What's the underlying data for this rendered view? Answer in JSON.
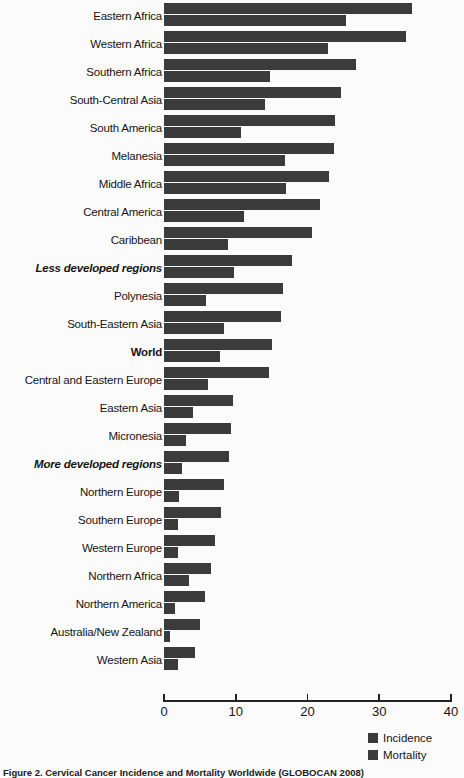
{
  "chart_data": {
    "type": "bar",
    "orientation": "horizontal",
    "title": "",
    "subtitle": "",
    "xlabel": "",
    "ylabel": "",
    "xlim": [
      0,
      40
    ],
    "xticks": [
      0,
      10,
      20,
      30,
      40
    ],
    "xtick_labels": [
      "0",
      "10",
      "20",
      "30",
      "40"
    ],
    "grid": false,
    "legend_position": "bottom-right",
    "bar_color": "#3b3b3b",
    "categories": [
      "Eastern Africa",
      "Western Africa",
      "Southern Africa",
      "South-Central Asia",
      "South America",
      "Melanesia",
      "Middle Africa",
      "Central America",
      "Caribbean",
      "Less developed regions",
      "Polynesia",
      "South-Eastern Asia",
      "World",
      "Central and Eastern Europe",
      "Eastern Asia",
      "Micronesia",
      "More developed regions",
      "Northern Europe",
      "Southern Europe",
      "Western Europe",
      "Northern Africa",
      "Northern America",
      "Australia/New Zealand",
      "Western Asia"
    ],
    "category_emphasis": [
      "none",
      "none",
      "none",
      "none",
      "none",
      "none",
      "none",
      "none",
      "none",
      "bold-italic",
      "none",
      "none",
      "bold",
      "none",
      "none",
      "none",
      "bold-italic",
      "none",
      "none",
      "none",
      "none",
      "none",
      "none",
      "none"
    ],
    "series": [
      {
        "name": "Incidence",
        "values": [
          34.5,
          33.7,
          26.8,
          24.6,
          23.9,
          23.7,
          23.0,
          21.7,
          20.6,
          17.8,
          16.6,
          16.3,
          15.1,
          14.6,
          9.6,
          9.4,
          9.0,
          8.4,
          7.9,
          7.1,
          6.6,
          5.7,
          5.0,
          4.3
        ]
      },
      {
        "name": "Mortality",
        "values": [
          25.3,
          22.8,
          14.8,
          14.1,
          10.8,
          16.8,
          17.0,
          11.1,
          8.9,
          9.8,
          5.9,
          8.3,
          7.8,
          6.1,
          4.0,
          3.0,
          2.5,
          2.1,
          2.0,
          1.9,
          3.5,
          1.6,
          0.9,
          2.0
        ]
      }
    ]
  },
  "legend": {
    "items": [
      {
        "label": "Incidence",
        "color": "#3b3b3b"
      },
      {
        "label": "Mortality",
        "color": "#3b3b3b"
      }
    ]
  },
  "caption": {
    "text": "Figure 2. Cervical Cancer Incidence and Mortality Worldwide (GLOBOCAN 2008)"
  }
}
